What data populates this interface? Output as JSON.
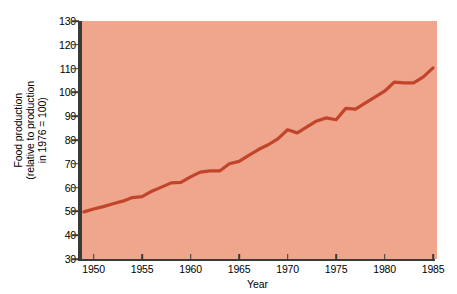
{
  "chart_data": {
    "type": "line",
    "title": "",
    "xlabel": "Year",
    "ylabel": "Food production (relative to production in 1976 = 100)",
    "ylabel_lines": [
      "Food production",
      "(relative to production",
      "in 1976 = 100)"
    ],
    "xlim": [
      1948.6,
      1985.2
    ],
    "ylim": [
      30,
      130
    ],
    "ytick_values": [
      30,
      40,
      50,
      60,
      70,
      80,
      90,
      100,
      110,
      120,
      130
    ],
    "ytick_labels": [
      "30",
      "40",
      "50",
      "60",
      "70",
      "80",
      "90",
      "100",
      "110",
      "120",
      "130"
    ],
    "xtick_values": [
      1950,
      1955,
      1960,
      1965,
      1970,
      1975,
      1980,
      1985
    ],
    "xtick_labels": [
      "1950",
      "1955",
      "1960",
      "1965",
      "1970",
      "1975",
      "1980",
      "1985"
    ],
    "grid": false,
    "legend": false,
    "plot_background": "#f0a58d",
    "line_color": "#c2452b",
    "line_width": 3.2,
    "axis_color": "#3a3a3a",
    "series": [
      {
        "name": "Food production index",
        "x": [
          1949,
          1950,
          1951,
          1952,
          1953,
          1954,
          1955,
          1956,
          1957,
          1958,
          1959,
          1960,
          1961,
          1962,
          1963,
          1964,
          1965,
          1966,
          1967,
          1968,
          1969,
          1970,
          1971,
          1972,
          1973,
          1974,
          1975,
          1976,
          1977,
          1978,
          1979,
          1980,
          1981,
          1982,
          1983,
          1984,
          1985
        ],
        "values": [
          49.8,
          51.0,
          52.0,
          53.2,
          54.3,
          55.8,
          56.2,
          58.5,
          60.2,
          62.0,
          62.2,
          64.5,
          66.5,
          67.0,
          67.0,
          70.0,
          71.0,
          73.5,
          76.0,
          78.0,
          80.5,
          84.3,
          83.0,
          85.5,
          88.0,
          89.3,
          88.5,
          93.3,
          93.0,
          95.5,
          98.0,
          100.5,
          104.3,
          104.0,
          104.0,
          106.5,
          110.3
        ]
      }
    ],
    "annotations": []
  },
  "axes": {
    "x_axis_name": "year-axis",
    "y_axis_name": "food-production-axis"
  }
}
